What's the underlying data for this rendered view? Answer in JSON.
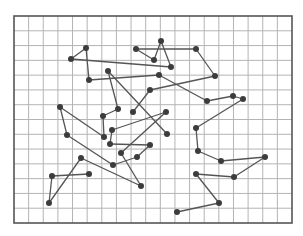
{
  "diagram": {
    "type": "random-walk-on-grid",
    "frame": {
      "x0": 14,
      "y0": 16,
      "x1": 292,
      "y1": 223
    },
    "grid": {
      "columns": 19,
      "rows": 14
    },
    "colors": {
      "background": "#ffffff",
      "grid": "#b4b4b4",
      "frame": "#555555",
      "edge": "#555555",
      "node": "#3c3c3c"
    },
    "nodes": [
      [
        71,
        59
      ],
      [
        86,
        48
      ],
      [
        89,
        80
      ],
      [
        108,
        71
      ],
      [
        136,
        49
      ],
      [
        161,
        41
      ],
      [
        154,
        60
      ],
      [
        196,
        49
      ],
      [
        171,
        67
      ],
      [
        159,
        75
      ],
      [
        215,
        76
      ],
      [
        150,
        90
      ],
      [
        207,
        101
      ],
      [
        233,
        96
      ],
      [
        243,
        99
      ],
      [
        60,
        107
      ],
      [
        67,
        135
      ],
      [
        104,
        137
      ],
      [
        103,
        116
      ],
      [
        118,
        109
      ],
      [
        133,
        112
      ],
      [
        166,
        112
      ],
      [
        167,
        134
      ],
      [
        112,
        130
      ],
      [
        110,
        144
      ],
      [
        150,
        145
      ],
      [
        121,
        153
      ],
      [
        137,
        157
      ],
      [
        113,
        165
      ],
      [
        81,
        158
      ],
      [
        52,
        176
      ],
      [
        89,
        174
      ],
      [
        49,
        203
      ],
      [
        141,
        186
      ],
      [
        196,
        128
      ],
      [
        198,
        151
      ],
      [
        221,
        161
      ],
      [
        265,
        157
      ],
      [
        234,
        177
      ],
      [
        196,
        174
      ],
      [
        219,
        203
      ],
      [
        177,
        212
      ]
    ],
    "edges": [
      [
        0,
        1
      ],
      [
        1,
        2
      ],
      [
        2,
        9
      ],
      [
        0,
        8
      ],
      [
        4,
        6
      ],
      [
        6,
        5
      ],
      [
        5,
        8
      ],
      [
        4,
        7
      ],
      [
        7,
        10
      ],
      [
        10,
        11
      ],
      [
        11,
        20
      ],
      [
        9,
        12
      ],
      [
        12,
        13
      ],
      [
        13,
        14
      ],
      [
        14,
        34
      ],
      [
        34,
        35
      ],
      [
        35,
        36
      ],
      [
        36,
        37
      ],
      [
        37,
        38
      ],
      [
        38,
        39
      ],
      [
        39,
        40
      ],
      [
        40,
        41
      ],
      [
        3,
        19
      ],
      [
        3,
        22
      ],
      [
        19,
        18
      ],
      [
        18,
        17
      ],
      [
        15,
        17
      ],
      [
        15,
        16
      ],
      [
        16,
        28
      ],
      [
        23,
        21
      ],
      [
        23,
        24
      ],
      [
        24,
        25
      ],
      [
        25,
        27
      ],
      [
        27,
        28
      ],
      [
        21,
        26
      ],
      [
        26,
        33
      ],
      [
        29,
        33
      ],
      [
        29,
        32
      ],
      [
        32,
        30
      ],
      [
        30,
        31
      ]
    ]
  }
}
